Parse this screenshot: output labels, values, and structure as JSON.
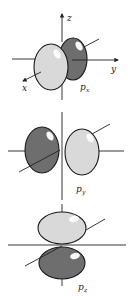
{
  "figure": {
    "panels": [
      {
        "id": "px",
        "label_main": "p",
        "label_sub": "x"
      },
      {
        "id": "py",
        "label_main": "p",
        "label_sub": "y"
      },
      {
        "id": "pz",
        "label_main": "p",
        "label_sub": "z"
      }
    ],
    "axes": {
      "x": "x",
      "y": "y",
      "z": "z"
    },
    "colors": {
      "light_lobe": "#d9d9d9",
      "dark_lobe": "#6e6e6e",
      "outline": "#1a1a1a"
    }
  }
}
